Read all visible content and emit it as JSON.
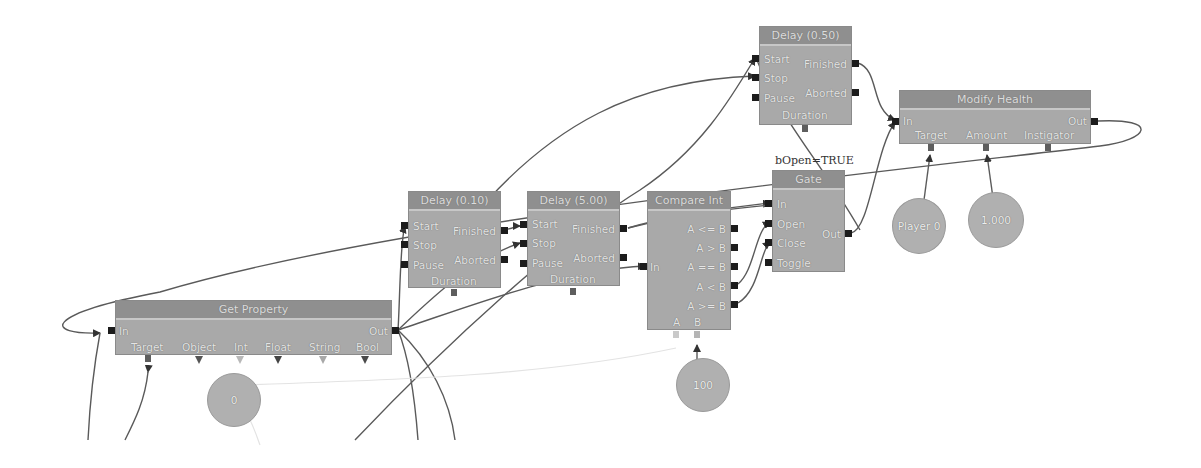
{
  "canvas": {
    "background": "#ffffff",
    "node_color": "#a9a9a9",
    "title_color": "#8f8f8f",
    "wire_color": "#555555"
  },
  "nodes": {
    "delay_050": {
      "title": "Delay (0.50)",
      "inputs": [
        "Start",
        "Stop",
        "Pause"
      ],
      "outputs": [
        "Finished",
        "Aborted"
      ],
      "variables": [
        "Duration"
      ]
    },
    "modify_health": {
      "title": "Modify Health",
      "inputs": [
        "In"
      ],
      "outputs": [
        "Out"
      ],
      "variables": [
        "Target",
        "Amount",
        "Instigator"
      ]
    },
    "gate": {
      "comment": "bOpen=TRUE",
      "title": "Gate",
      "inputs": [
        "In",
        "Open",
        "Close",
        "Toggle"
      ],
      "outputs": [
        "Out"
      ]
    },
    "compare_int": {
      "title": "Compare Int",
      "inputs": [
        "In"
      ],
      "outputs": [
        "A <= B",
        "A > B",
        "A == B",
        "A < B",
        "A >= B"
      ],
      "variables": [
        "A",
        "B"
      ]
    },
    "delay_010": {
      "title": "Delay (0.10)",
      "inputs": [
        "Start",
        "Stop",
        "Pause"
      ],
      "outputs": [
        "Finished",
        "Aborted"
      ],
      "variables": [
        "Duration"
      ]
    },
    "delay_500": {
      "title": "Delay (5.00)",
      "inputs": [
        "Start",
        "Stop",
        "Pause"
      ],
      "outputs": [
        "Finished",
        "Aborted"
      ],
      "variables": [
        "Duration"
      ]
    },
    "get_property": {
      "title": "Get Property",
      "inputs": [
        "In"
      ],
      "outputs": [
        "Out"
      ],
      "variables": [
        "Target",
        "Object",
        "Int",
        "Float",
        "String",
        "Bool"
      ]
    }
  },
  "variables": {
    "zero": "0",
    "hundred": "100",
    "player": "Player 0",
    "amount": "1.000"
  }
}
